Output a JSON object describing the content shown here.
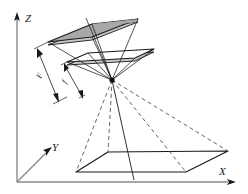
{
  "figure": {
    "kind": "perspective-projection-geometry",
    "background_color": "#ffffff",
    "line_color": "#1a1a1a",
    "axis_color": "#8a8a8a",
    "shade_color": "#a8a8a8",
    "shade_side_color": "#c9c9c9",
    "dashed_ray_color": "#555555"
  },
  "axes": {
    "z_label": "Z",
    "y_label": "Y",
    "x_label": "X",
    "origin": {
      "x": 17,
      "y": 182
    }
  },
  "dimensions": [
    {
      "label": "F",
      "name": "outer-focal-distance"
    },
    {
      "label": "f",
      "name": "inner-focal-distance"
    }
  ],
  "planes": {
    "image_plane_label": "",
    "sensor_plane_label": "",
    "ground_plane_label": ""
  },
  "projection_center": {
    "x": 112,
    "y": 80,
    "label": ""
  }
}
